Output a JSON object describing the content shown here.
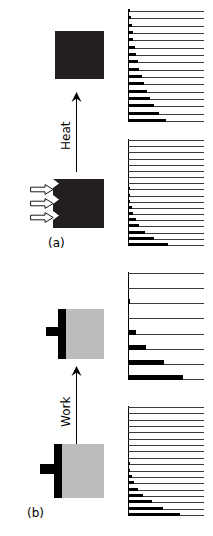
{
  "figure": {
    "background_color": "#ffffff",
    "ink_color": "#000000",
    "block_dark_color": "#231f20",
    "block_gray_color": "#bcbcbc",
    "level_color": "#3a3a3a"
  },
  "panels": [
    {
      "id": "a",
      "caption": "(a)",
      "process_label": "Heat",
      "process_arrow_direction": "up",
      "blocks": {
        "final": {
          "name": "hot-block",
          "fill": "#231f20",
          "edge": "straight",
          "arrows": []
        },
        "initial": {
          "name": "heated-block",
          "fill": "#231f20",
          "edge": "notched",
          "arrows": [
            "heat-arrow-1",
            "heat-arrow-2",
            "heat-arrow-3"
          ],
          "arrow_count": 3,
          "arrow_fill": "#ffffff"
        }
      }
    },
    {
      "id": "b",
      "caption": "(b)",
      "process_label": "Work",
      "process_arrow_direction": "up",
      "blocks": {
        "final": {
          "name": "worked-block",
          "fill": "#bcbcbc",
          "edge": "piston",
          "piston_fill": "#000000"
        },
        "initial": {
          "name": "cold-block",
          "fill": "#bcbcbc",
          "edge": "piston",
          "piston_fill": "#000000"
        }
      }
    }
  ],
  "chart_data": [
    {
      "id": "ladder-a-final",
      "type": "bar",
      "title": "Populations after heating",
      "orientation": "horizontal",
      "xlabel": "Population",
      "ylabel": "Energy",
      "axis": "left",
      "level_count": 16,
      "levels_full_width": 76,
      "categories": [
        "E16",
        "E15",
        "E14",
        "E13",
        "E12",
        "E11",
        "E10",
        "E9",
        "E8",
        "E7",
        "E6",
        "E5",
        "E4",
        "E3",
        "E2",
        "E1"
      ],
      "values": [
        1,
        4,
        5,
        6,
        7,
        9,
        11,
        13,
        15,
        18,
        21,
        25,
        29,
        34,
        41,
        50
      ]
    },
    {
      "id": "ladder-a-initial",
      "type": "bar",
      "title": "Populations before heating",
      "orientation": "horizontal",
      "xlabel": "Population",
      "ylabel": "Energy",
      "axis": "left",
      "level_count": 18,
      "levels_full_width": 76,
      "categories": [
        "E18",
        "E17",
        "E16",
        "E15",
        "E14",
        "E13",
        "E12",
        "E11",
        "E10",
        "E9",
        "E8",
        "E7",
        "E6",
        "E5",
        "E4",
        "E3",
        "E2",
        "E1"
      ],
      "values": [
        0,
        0,
        0,
        0,
        0,
        0,
        0,
        0,
        1,
        2,
        3,
        5,
        7,
        10,
        15,
        22,
        34,
        52
      ]
    },
    {
      "id": "ladder-b-final",
      "type": "bar",
      "title": "Populations after work",
      "orientation": "horizontal",
      "xlabel": "Population",
      "ylabel": "Energy",
      "axis": "left",
      "level_count": 8,
      "levels_full_width": 76,
      "categories": [
        "E8",
        "E7",
        "E6",
        "E5",
        "E4",
        "E3",
        "E2",
        "E1"
      ],
      "values": [
        0,
        0,
        2,
        0,
        10,
        24,
        48,
        72
      ]
    },
    {
      "id": "ladder-b-initial",
      "type": "bar",
      "title": "Populations before work",
      "orientation": "horizontal",
      "xlabel": "Population",
      "ylabel": "Energy",
      "axis": "left",
      "level_count": 18,
      "levels_full_width": 76,
      "categories": [
        "E18",
        "E17",
        "E16",
        "E15",
        "E14",
        "E13",
        "E12",
        "E11",
        "E10",
        "E9",
        "E8",
        "E7",
        "E6",
        "E5",
        "E4",
        "E3",
        "E2",
        "E1"
      ],
      "values": [
        0,
        0,
        0,
        0,
        0,
        0,
        0,
        0,
        0,
        1,
        3,
        5,
        8,
        13,
        20,
        31,
        46,
        68
      ]
    }
  ]
}
